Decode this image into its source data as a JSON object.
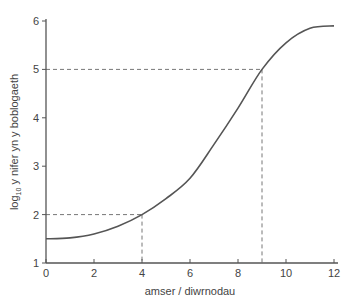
{
  "chart_data": {
    "type": "line",
    "title": "",
    "xlabel": "amser / diwrnodau",
    "ylabel_main": "log",
    "ylabel_sub": "10",
    "ylabel_rest": " y nifer yn y boblogaeth",
    "xlim": [
      0,
      12
    ],
    "ylim": [
      1,
      6
    ],
    "xticks": [
      0,
      2,
      4,
      6,
      8,
      10,
      12
    ],
    "yticks": [
      1,
      2,
      3,
      4,
      5,
      6
    ],
    "grid": false,
    "series": [
      {
        "name": "population",
        "x": [
          0,
          1,
          2,
          3,
          4,
          5,
          6,
          7,
          8,
          9,
          10,
          11,
          12
        ],
        "y": [
          1.5,
          1.52,
          1.6,
          1.76,
          2.0,
          2.33,
          2.75,
          3.45,
          4.2,
          5.0,
          5.55,
          5.85,
          5.9
        ]
      }
    ],
    "annotations": [
      {
        "type": "dashed-guide",
        "x": 4,
        "y": 2
      },
      {
        "type": "dashed-guide",
        "x": 9,
        "y": 5
      }
    ],
    "colors": {
      "line": "#555555",
      "axis": "#555555",
      "guide": "#777777"
    }
  }
}
